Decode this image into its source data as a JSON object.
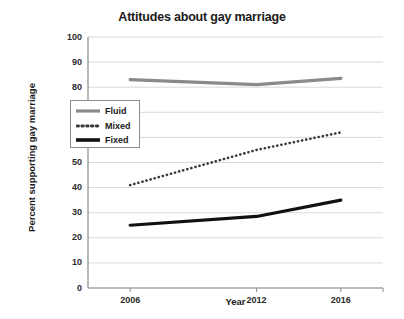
{
  "chart_data": {
    "type": "line",
    "title": "Attitudes about gay marriage",
    "xlabel": "Year",
    "ylabel": "Percent supporting gay marriage",
    "categories": [
      "2006",
      "2012",
      "2016"
    ],
    "x": [
      2006,
      2012,
      2016
    ],
    "xlim": [
      2004,
      2018
    ],
    "ylim": [
      0,
      100
    ],
    "ytick_labels": [
      "0",
      "10",
      "20",
      "30",
      "40",
      "50",
      "60",
      "70",
      "80",
      "90",
      "100"
    ],
    "yticks": [
      0,
      10,
      20,
      30,
      40,
      50,
      60,
      70,
      80,
      90,
      100
    ],
    "xtick_labels": [
      "2006",
      "2012",
      "2016"
    ],
    "grid": "horizontal",
    "legend_position": "upper left inside",
    "series": [
      {
        "name": "Fluid",
        "values": [
          83,
          81,
          83.5
        ],
        "color": "#8a8a8a",
        "style": "solid",
        "width": 3.2
      },
      {
        "name": "Mixed",
        "values": [
          41,
          55,
          62
        ],
        "color": "#3a3a3a",
        "style": "dotted",
        "width": 2.6
      },
      {
        "name": "Fixed",
        "values": [
          25,
          28.5,
          35
        ],
        "color": "#111111",
        "style": "solid",
        "width": 3.2
      }
    ]
  },
  "legend": {
    "items": [
      {
        "label": "Fluid"
      },
      {
        "label": "Mixed"
      },
      {
        "label": "Fixed"
      }
    ]
  },
  "axis": {
    "y_labels": [
      "100",
      "90",
      "80",
      "70",
      "60",
      "50",
      "40",
      "30",
      "20",
      "10",
      "0"
    ],
    "x_labels": [
      "2006",
      "2012",
      "2016"
    ]
  },
  "colors": {
    "background": "#ffffff",
    "grid": "#d9d9d9",
    "axis": "#8c8c8c",
    "text": "#1a1a1a",
    "fluid": "#8a8a8a",
    "mixed": "#3a3a3a",
    "fixed": "#111111"
  }
}
